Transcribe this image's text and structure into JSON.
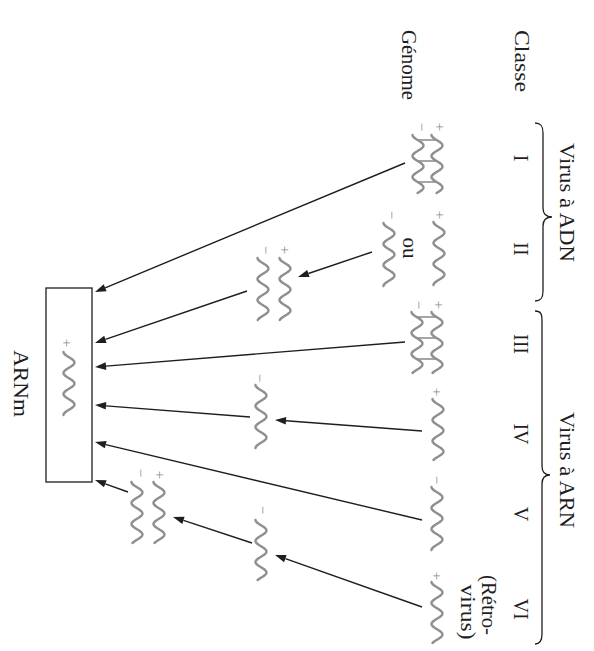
{
  "headers": {
    "classe": "Classe",
    "genome": "Génome"
  },
  "groups": [
    {
      "label": "Virus à ADN",
      "classes": [
        "I",
        "II"
      ]
    },
    {
      "label": "Virus à ARN",
      "classes": [
        "III",
        "IV",
        "V",
        "VI"
      ]
    }
  ],
  "classes": [
    {
      "numeral": "I",
      "genome": {
        "strands": [
          "−",
          "+"
        ],
        "paired": true
      }
    },
    {
      "numeral": "II",
      "genome": {
        "alternatives": [
          [
            "+"
          ],
          [
            "−"
          ]
        ],
        "or_label": "ou"
      },
      "intermediates": [
        {
          "strands": [
            "−",
            "+"
          ]
        }
      ]
    },
    {
      "numeral": "III",
      "genome": {
        "strands": [
          "−",
          "+"
        ],
        "paired": true
      }
    },
    {
      "numeral": "IV",
      "genome": {
        "strands": [
          "+"
        ]
      },
      "intermediates": [
        {
          "strands": [
            "−"
          ]
        }
      ]
    },
    {
      "numeral": "V",
      "genome": {
        "strands": [
          "−"
        ]
      }
    },
    {
      "numeral": "VI",
      "note": [
        "(Rétro-",
        "virus)"
      ],
      "genome": {
        "strands": [
          "+"
        ]
      },
      "intermediates": [
        {
          "strands": [
            "−"
          ]
        },
        {
          "strands": [
            "−",
            "+"
          ]
        }
      ]
    }
  ],
  "target": {
    "label": "ARNm",
    "strands": [
      "+"
    ]
  },
  "arrows": [
    {
      "from": "classes.0.genome",
      "to": "target"
    },
    {
      "from": "classes.1.genome",
      "to": "classes.1.intermediates.0"
    },
    {
      "from": "classes.1.intermediates.0",
      "to": "target"
    },
    {
      "from": "classes.2.genome",
      "to": "target"
    },
    {
      "from": "classes.3.genome",
      "to": "classes.3.intermediates.0"
    },
    {
      "from": "classes.3.intermediates.0",
      "to": "target"
    },
    {
      "from": "classes.4.genome",
      "to": "target"
    },
    {
      "from": "classes.5.genome",
      "to": "classes.5.intermediates.0"
    },
    {
      "from": "classes.5.intermediates.0",
      "to": "classes.5.intermediates.1"
    },
    {
      "from": "classes.5.intermediates.1",
      "to": "target"
    }
  ],
  "colors": {
    "line": "#1e1e1e",
    "text": "#1e1e1e",
    "strand": "#8f8f8f",
    "background": "#ffffff"
  }
}
